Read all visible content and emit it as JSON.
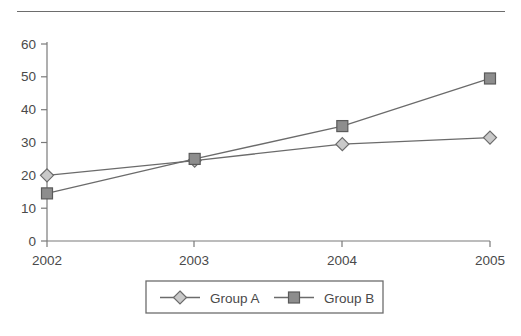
{
  "chart_data": {
    "type": "line",
    "title": "",
    "subtitle": "",
    "xlabel": "",
    "ylabel": "",
    "categories": [
      "2002",
      "2003",
      "2004",
      "2005"
    ],
    "x": [
      2002,
      2003,
      2004,
      2005
    ],
    "series": [
      {
        "name": "Group A",
        "marker": "diamond",
        "marker_fill": "#c9c9c9",
        "line_color": "#6b6b6b",
        "values": [
          20,
          24.5,
          29.5,
          31.5
        ]
      },
      {
        "name": "Group B",
        "marker": "square",
        "marker_fill": "#8d8d8d",
        "line_color": "#6b6b6b",
        "values": [
          14.5,
          25,
          35,
          49.5
        ]
      }
    ],
    "ylim": [
      0,
      60
    ],
    "yticks": [
      0,
      10,
      20,
      30,
      40,
      50,
      60
    ],
    "ytick_labels": [
      "0",
      "10",
      "20",
      "30",
      "40",
      "50",
      "60"
    ],
    "xtick_labels": [
      "2002",
      "2003",
      "2004",
      "2005"
    ],
    "grid": false,
    "legend_position": "bottom-center",
    "legend_entries": [
      "Group A",
      "Group B"
    ],
    "axis_color": "#7a7a7a",
    "background": "#ffffff"
  },
  "decorations": {
    "top_rule": "horizontal-rule"
  }
}
